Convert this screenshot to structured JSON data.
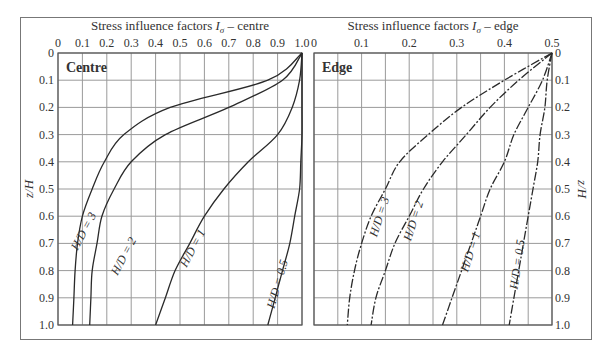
{
  "chart_data": [
    {
      "type": "line",
      "panel_label": "Centre",
      "title": "Stress influence factors Iσ – centre",
      "xlabel": "Stress influence factors Iσ – centre",
      "ylabel": "z/H",
      "xlim": [
        0,
        1.0
      ],
      "ylim": [
        0,
        1.0
      ],
      "y_inverted": true,
      "x_axis_position": "top",
      "grid": true,
      "x_ticks": [
        "0",
        "0.1",
        "0.2",
        "0.3",
        "0.4",
        "0.5",
        "0.6",
        "0.7",
        "0.8",
        "0.9",
        "1.0"
      ],
      "y_ticks": [
        "0",
        "0.1",
        "0.2",
        "0.3",
        "0.4",
        "0.5",
        "0.6",
        "0.7",
        "0.8",
        "0.9",
        "1.0"
      ],
      "line_style": "solid",
      "series": [
        {
          "name": "H/D = 3",
          "z": [
            0,
            0.1,
            0.2,
            0.3,
            0.4,
            0.5,
            0.6,
            0.7,
            0.8,
            0.9,
            1.0
          ],
          "I": [
            1.0,
            0.86,
            0.46,
            0.27,
            0.19,
            0.14,
            0.1,
            0.08,
            0.07,
            0.065,
            0.06
          ]
        },
        {
          "name": "H/D = 2",
          "z": [
            0,
            0.1,
            0.2,
            0.3,
            0.4,
            0.5,
            0.6,
            0.7,
            0.8,
            0.9,
            1.0
          ],
          "I": [
            1.0,
            0.92,
            0.7,
            0.44,
            0.3,
            0.23,
            0.18,
            0.16,
            0.14,
            0.135,
            0.13
          ]
        },
        {
          "name": "H/D = 1",
          "z": [
            0,
            0.1,
            0.2,
            0.3,
            0.4,
            0.5,
            0.6,
            0.7,
            0.8,
            0.9,
            1.0
          ],
          "I": [
            1.0,
            0.99,
            0.96,
            0.9,
            0.78,
            0.68,
            0.6,
            0.54,
            0.48,
            0.44,
            0.4
          ]
        },
        {
          "name": "H/D = 0.5",
          "z": [
            0,
            0.1,
            0.2,
            0.3,
            0.4,
            0.5,
            0.6,
            0.7,
            0.8,
            0.9,
            1.0
          ],
          "I": [
            1.0,
            1.0,
            1.0,
            1.0,
            0.995,
            0.99,
            0.97,
            0.95,
            0.92,
            0.89,
            0.86
          ]
        }
      ]
    },
    {
      "type": "line",
      "panel_label": "Edge",
      "title": "Stress influence factors Iσ – edge",
      "xlabel": "Stress influence factors Iσ – edge",
      "ylabel": "z/H",
      "xlim": [
        0,
        0.5
      ],
      "ylim": [
        0,
        1.0
      ],
      "y_inverted": true,
      "x_axis_position": "top",
      "grid": true,
      "x_ticks": [
        "0",
        "0.1",
        "0.2",
        "0.3",
        "0.4",
        "0.5"
      ],
      "y_ticks": [
        "0",
        "0.1",
        "0.2",
        "0.3",
        "0.4",
        "0.5",
        "0.6",
        "0.7",
        "0.8",
        "0.9",
        "1.0"
      ],
      "line_style": "dash-dot",
      "series": [
        {
          "name": "H/D = 3",
          "z": [
            0,
            0.1,
            0.2,
            0.3,
            0.4,
            0.5,
            0.6,
            0.7,
            0.8,
            0.9,
            1.0
          ],
          "I": [
            0.5,
            0.4,
            0.31,
            0.24,
            0.18,
            0.15,
            0.12,
            0.1,
            0.085,
            0.075,
            0.07
          ]
        },
        {
          "name": "H/D = 2",
          "z": [
            0,
            0.1,
            0.2,
            0.3,
            0.4,
            0.5,
            0.6,
            0.7,
            0.8,
            0.9,
            1.0
          ],
          "I": [
            0.5,
            0.43,
            0.37,
            0.32,
            0.27,
            0.23,
            0.2,
            0.17,
            0.15,
            0.13,
            0.12
          ]
        },
        {
          "name": "H/D = 1",
          "z": [
            0,
            0.1,
            0.2,
            0.3,
            0.4,
            0.5,
            0.6,
            0.7,
            0.8,
            0.9,
            1.0
          ],
          "I": [
            0.5,
            0.48,
            0.45,
            0.42,
            0.4,
            0.37,
            0.35,
            0.33,
            0.31,
            0.29,
            0.27
          ]
        },
        {
          "name": "H/D = 0.5",
          "z": [
            0,
            0.1,
            0.2,
            0.3,
            0.4,
            0.5,
            0.6,
            0.7,
            0.8,
            0.9,
            1.0
          ],
          "I": [
            0.5,
            0.49,
            0.485,
            0.475,
            0.47,
            0.46,
            0.45,
            0.44,
            0.43,
            0.42,
            0.41
          ]
        }
      ]
    }
  ],
  "labels": {
    "centre_title_pre": "Stress influence factors ",
    "centre_title_post": " – centre",
    "edge_title_pre": "Stress influence factors ",
    "edge_title_post": " – edge",
    "symbol_I": "I",
    "symbol_sigma": "σ",
    "centre_panel": "Centre",
    "edge_panel": "Edge",
    "y_axis": "z/H"
  },
  "curve_labels": {
    "centre": [
      "H/D = 3",
      "H/D = 2",
      "H/D = 1",
      "H/D = 0.5"
    ],
    "edge": [
      "H/D = 3",
      "H/D = 2",
      "H/D = 1",
      "H/D = 0.5"
    ]
  },
  "colors": {
    "grid": "#9a9a9a",
    "frame": "#555555",
    "curve": "#2a2a2a",
    "text": "#333333"
  }
}
